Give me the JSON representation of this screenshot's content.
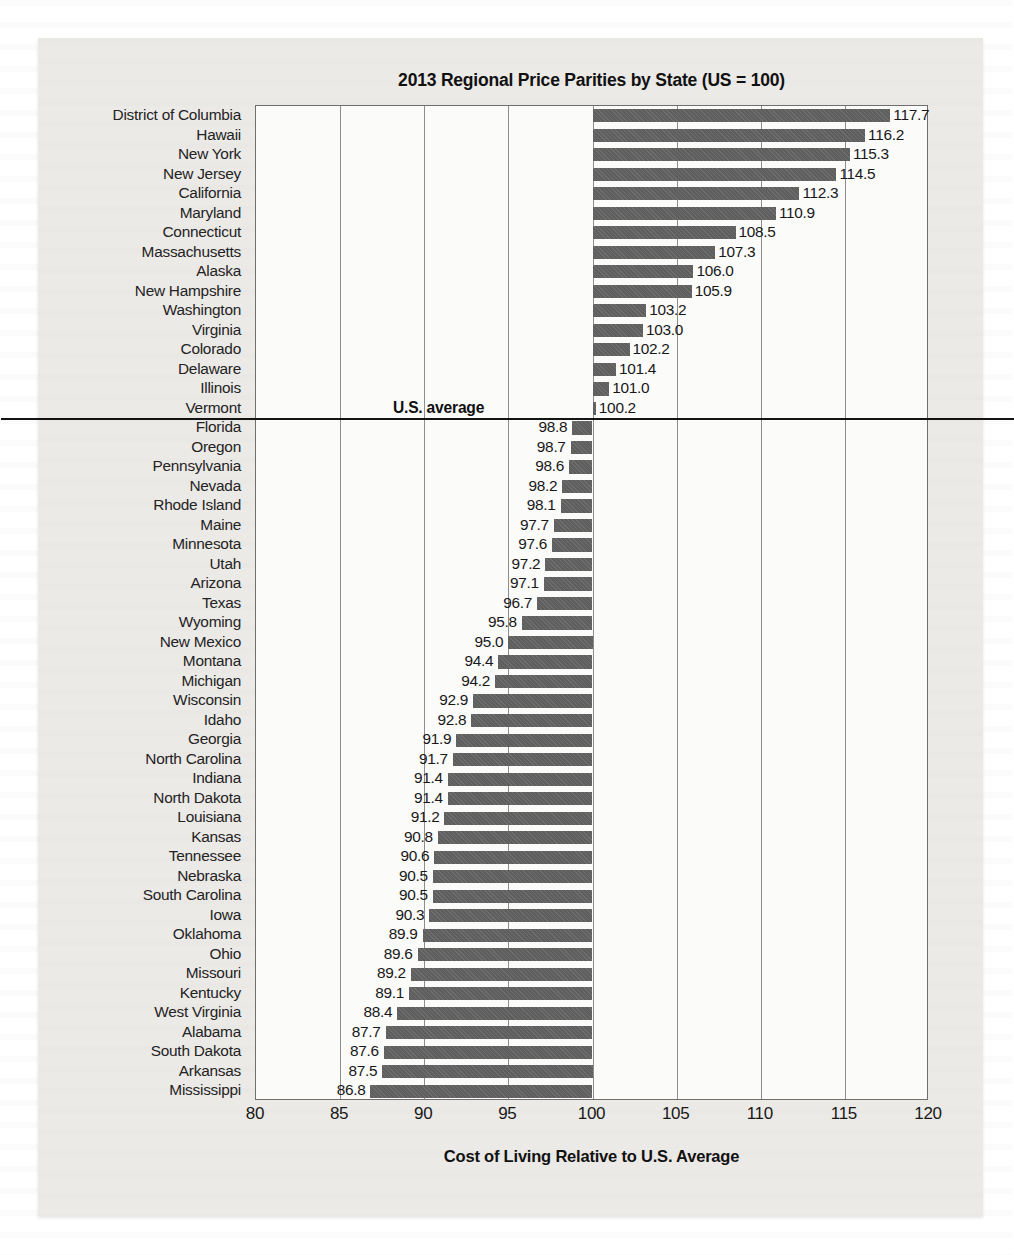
{
  "chart_data": {
    "type": "bar",
    "orientation": "horizontal",
    "title": "2013 Regional Price Parities by State (US = 100)",
    "xlabel": "Cost of Living Relative to U.S. Average",
    "ylabel": "",
    "xlim": [
      80,
      120
    ],
    "xticks": [
      80,
      85,
      90,
      95,
      100,
      105,
      110,
      115,
      120
    ],
    "baseline": 100,
    "grid": true,
    "legend_position": "none",
    "annotations": [
      {
        "text": "U.S. average",
        "value": 100
      }
    ],
    "bar_color": "#5e5e5e",
    "categories": [
      "District of Columbia",
      "Hawaii",
      "New York",
      "New Jersey",
      "California",
      "Maryland",
      "Connecticut",
      "Massachusetts",
      "Alaska",
      "New Hampshire",
      "Washington",
      "Virginia",
      "Colorado",
      "Delaware",
      "Illinois",
      "Vermont",
      "Florida",
      "Oregon",
      "Pennsylvania",
      "Nevada",
      "Rhode Island",
      "Maine",
      "Minnesota",
      "Utah",
      "Arizona",
      "Texas",
      "Wyoming",
      "New Mexico",
      "Montana",
      "Michigan",
      "Wisconsin",
      "Idaho",
      "Georgia",
      "North Carolina",
      "Indiana",
      "North Dakota",
      "Louisiana",
      "Kansas",
      "Tennessee",
      "Nebraska",
      "South Carolina",
      "Iowa",
      "Oklahoma",
      "Ohio",
      "Missouri",
      "Kentucky",
      "West Virginia",
      "Alabama",
      "South Dakota",
      "Arkansas",
      "Mississippi"
    ],
    "values": [
      117.7,
      116.2,
      115.3,
      114.5,
      112.3,
      110.9,
      108.5,
      107.3,
      106.0,
      105.9,
      103.2,
      103.0,
      102.2,
      101.4,
      101.0,
      100.2,
      98.8,
      98.7,
      98.6,
      98.2,
      98.1,
      97.7,
      97.6,
      97.2,
      97.1,
      96.7,
      95.8,
      95.0,
      94.4,
      94.2,
      92.9,
      92.8,
      91.9,
      91.7,
      91.4,
      91.4,
      91.2,
      90.8,
      90.6,
      90.5,
      90.5,
      90.3,
      89.9,
      89.6,
      89.2,
      89.1,
      88.4,
      87.7,
      87.6,
      87.5,
      86.8
    ],
    "value_labels": [
      "117.7",
      "116.2",
      "115.3",
      "114.5",
      "112.3",
      "110.9",
      "108.5",
      "107.3",
      "106.0",
      "105.9",
      "103.2",
      "103.0",
      "102.2",
      "101.4",
      "101.0",
      "100.2",
      "98.8",
      "98.7",
      "98.6",
      "98.2",
      "98.1",
      "97.7",
      "97.6",
      "97.2",
      "97.1",
      "96.7",
      "95.8",
      "95.0",
      "94.4",
      "94.2",
      "92.9",
      "92.8",
      "91.9",
      "91.7",
      "91.4",
      "91.4",
      "91.2",
      "90.8",
      "90.6",
      "90.5",
      "90.5",
      "90.3",
      "89.9",
      "89.6",
      "89.2",
      "89.1",
      "88.4",
      "87.7",
      "87.6",
      "87.5",
      "86.8"
    ]
  }
}
